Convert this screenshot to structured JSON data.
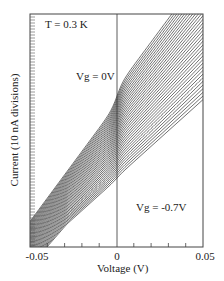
{
  "chart_data": {
    "type": "line",
    "title": "",
    "xlabel": "Voltage (V)",
    "ylabel": "Current (10 nA divisions)",
    "xlim": [
      -0.05,
      0.05
    ],
    "x_tick_labels": [
      "-0.05",
      "0",
      "0.05"
    ],
    "x_minor_ticks": [
      -0.04,
      -0.03,
      -0.02,
      -0.01,
      0.01,
      0.02,
      0.03,
      0.04
    ],
    "y_tick_spacing_label": "10 nA divisions",
    "grid": false,
    "vertical_reference_line_x": 0,
    "annotations": [
      {
        "text": "T = 0.3 K",
        "position": "top-left"
      },
      {
        "text": "Vg = 0V",
        "position": "near top curve, left of V=0"
      },
      {
        "text": "Vg = -0.7V",
        "position": "below bottom curve, right of V=0"
      }
    ],
    "series_description": "Family of ~36 I-V curves offset vertically, gate voltage stepped from Vg = 0V (top) to Vg = -0.7V (bottom); each curve roughly linear with a step/plateau near V = 0 that becomes less pronounced at more negative gate voltages",
    "series_count": 36,
    "gate_voltage_range": [
      0,
      -0.7
    ],
    "series": [
      {
        "name": "Vg = 0V",
        "slope_px_per_V": 1.35,
        "step_px": 16
      },
      {
        "name": "Vg = -0.7V",
        "slope_px_per_V": 0.9,
        "step_px": 2
      }
    ]
  },
  "labels": {
    "temperature": "T = 0.3 K",
    "vg_top": "Vg = 0V",
    "vg_bottom": "Vg = -0.7V",
    "x_axis": "Voltage (V)",
    "y_axis": "Current (10 nA divisions)",
    "x_min": "-0.05",
    "x_zero": "0",
    "x_max": "0.05"
  }
}
